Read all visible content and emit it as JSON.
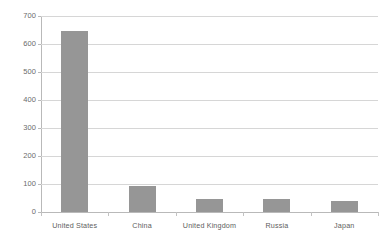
{
  "chart_data": {
    "type": "bar",
    "title": "",
    "subtitle": "",
    "xlabel": "",
    "ylabel": "",
    "categories": [
      "United States",
      "China",
      "United Kingdom",
      "Russia",
      "Japan"
    ],
    "values": [
      645,
      93,
      48,
      45,
      38
    ],
    "series": [
      {
        "name": "",
        "values": [
          645,
          93,
          48,
          45,
          38
        ]
      }
    ],
    "ylim": [
      0,
      700
    ],
    "y_ticks": [
      0,
      100,
      200,
      300,
      400,
      500,
      600,
      700
    ],
    "y_tick_labels": [
      "0",
      "100",
      "200",
      "300",
      "400",
      "500",
      "600",
      "700"
    ],
    "grid": true,
    "grid_axis": "y",
    "legend": false,
    "legend_position": "none",
    "bar_color": "#969696",
    "gridline_color": "#d6d6d6",
    "axis_color": "#b9b9b9",
    "label_color": "#5e5e5e",
    "background": "#ffffff"
  }
}
